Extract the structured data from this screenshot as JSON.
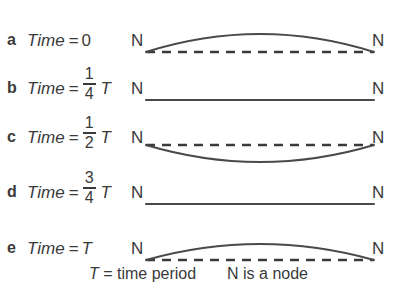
{
  "diagram": {
    "title": "Standing wave on a string at successive times",
    "line_color": "#3a3a3a",
    "background_color": "#ffffff",
    "node_label": "N",
    "rows": [
      {
        "letter": "a",
        "label_prefix": "Time",
        "equals": "=",
        "value": "0",
        "fraction": null,
        "t_symbol": "",
        "node_left": "N",
        "node_right": "N",
        "shape": "crest",
        "baseline_style": "dashed"
      },
      {
        "letter": "b",
        "label_prefix": "Time",
        "equals": "=",
        "value": "",
        "fraction": {
          "numerator": "1",
          "denominator": "4"
        },
        "t_symbol": "T",
        "node_left": "N",
        "node_right": "N",
        "shape": "flat",
        "baseline_style": "solid"
      },
      {
        "letter": "c",
        "label_prefix": "Time",
        "equals": "=",
        "value": "",
        "fraction": {
          "numerator": "1",
          "denominator": "2"
        },
        "t_symbol": "T",
        "node_left": "N",
        "node_right": "N",
        "shape": "trough",
        "baseline_style": "dashed"
      },
      {
        "letter": "d",
        "label_prefix": "Time",
        "equals": "=",
        "value": "",
        "fraction": {
          "numerator": "3",
          "denominator": "4"
        },
        "t_symbol": "T",
        "node_left": "N",
        "node_right": "N",
        "shape": "flat",
        "baseline_style": "solid"
      },
      {
        "letter": "e",
        "label_prefix": "Time",
        "equals": "=",
        "value": "T",
        "fraction": null,
        "t_symbol": "",
        "node_left": "N",
        "node_right": "N",
        "shape": "crest",
        "baseline_style": "dashed"
      }
    ],
    "caption": {
      "t_symbol": "T",
      "definition": "= time period",
      "node_definition": "N is a node"
    }
  }
}
